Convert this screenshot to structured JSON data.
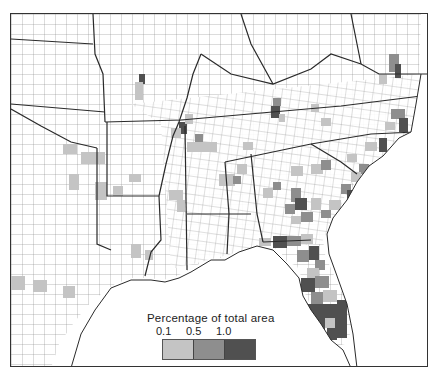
{
  "map": {
    "subject": "Southeastern United States counties",
    "frame": {
      "x": 10,
      "y": 13,
      "width": 418,
      "height": 354
    }
  },
  "legend": {
    "title": "Percentage of total area",
    "ticks": [
      "0.1",
      "0.5",
      "1.0"
    ],
    "classes": [
      {
        "label": "0.1–0.5",
        "color": "#c4c4c4"
      },
      {
        "label": "0.5–1.0",
        "color": "#8e8e8e"
      },
      {
        "label": ">1.0",
        "color": "#505050"
      }
    ]
  },
  "colors": {
    "land": "#ffffff",
    "county_line": "#7a7a7a",
    "state_line": "#2a2a2a",
    "water": "#ffffff",
    "light": "#c4c4c4",
    "medium": "#8e8e8e",
    "dark": "#505050"
  }
}
